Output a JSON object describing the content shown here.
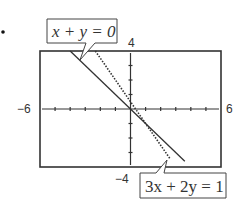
{
  "bullet": "•",
  "chart_data": {
    "type": "line",
    "title": "",
    "xlabel": "",
    "ylabel": "",
    "xlim": [
      -6,
      6
    ],
    "ylim": [
      -4,
      4
    ],
    "xscale": 1,
    "yscale": 1,
    "grid": false,
    "tick_labels": {
      "xmin": "−6",
      "xmax": "6",
      "ymin": "−4",
      "ymax": "4"
    },
    "series": [
      {
        "name": "x + y = 0",
        "equation": "y = -x",
        "style": "solid",
        "x": [
          -4,
          -2,
          0,
          2,
          3.6
        ],
        "y": [
          4,
          2,
          0,
          -2,
          -3.6
        ]
      },
      {
        "name": "3x + 2y = 1",
        "equation": "y = 0.5 - 1.5x",
        "style": "dotted",
        "x": [
          -2.33,
          -1,
          0,
          1,
          2.6
        ],
        "y": [
          4,
          2,
          0.5,
          -1,
          -3.4
        ]
      }
    ],
    "annotations": [
      {
        "text": "x + y = 0",
        "points_to": "top end of solid line",
        "position": "above-left of window"
      },
      {
        "text": "3x + 2y = 1",
        "points_to": "bottom end of dotted line",
        "position": "below-right of window"
      }
    ],
    "intersection": {
      "x": 1,
      "y": -1
    }
  }
}
